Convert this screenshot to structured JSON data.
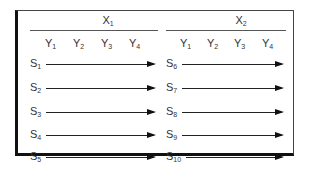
{
  "groups": [
    {
      "label": "X",
      "sub": "1",
      "columns": [
        {
          "l": "Y",
          "s": "1"
        },
        {
          "l": "Y",
          "s": "2"
        },
        {
          "l": "Y",
          "s": "3"
        },
        {
          "l": "Y",
          "s": "4"
        }
      ],
      "rows": [
        {
          "l": "S",
          "s": "1"
        },
        {
          "l": "S",
          "s": "2"
        },
        {
          "l": "S",
          "s": "3"
        },
        {
          "l": "S",
          "s": "4"
        },
        {
          "l": "S",
          "s": "5"
        }
      ]
    },
    {
      "label": "X",
      "sub": "2",
      "columns": [
        {
          "l": "Y",
          "s": "1"
        },
        {
          "l": "Y",
          "s": "2"
        },
        {
          "l": "Y",
          "s": "3"
        },
        {
          "l": "Y",
          "s": "4"
        }
      ],
      "rows": [
        {
          "l": "S",
          "s": "6"
        },
        {
          "l": "S",
          "s": "7"
        },
        {
          "l": "S",
          "s": "8"
        },
        {
          "l": "S",
          "s": "9"
        },
        {
          "l": "S",
          "s": "10"
        }
      ]
    }
  ]
}
